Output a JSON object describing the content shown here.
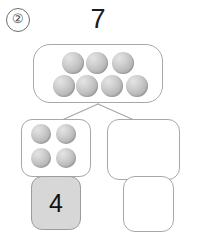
{
  "problem": {
    "number_label": "②"
  },
  "total": {
    "label": "7",
    "counter_count": 7,
    "rows": [
      3,
      4
    ]
  },
  "parts": {
    "left": {
      "counter_count": 4,
      "rows": [
        2,
        2
      ],
      "answer_value": "4",
      "answer_filled": true,
      "answer_fill_color": "#d7d7d7"
    },
    "right": {
      "counter_count": 0,
      "rows": [],
      "answer_value": "",
      "answer_filled": false,
      "answer_fill_color": "#ffffff"
    }
  },
  "style": {
    "box_border_color": "#a8a8a8",
    "counter_color": "#bcbcbc",
    "connector_color": "#a8a8a8",
    "text_color": "#111111",
    "background": "#ffffff"
  },
  "counters": {
    "top_box": [
      {
        "cx": 72,
        "cy": 62,
        "r": 11,
        "name": "counter-1"
      },
      {
        "cx": 96,
        "cy": 62,
        "r": 11,
        "name": "counter-2"
      },
      {
        "cx": 122,
        "cy": 62,
        "r": 11,
        "name": "counter-3"
      },
      {
        "cx": 63,
        "cy": 85,
        "r": 11,
        "name": "counter-4"
      },
      {
        "cx": 86,
        "cy": 85,
        "r": 11,
        "name": "counter-5"
      },
      {
        "cx": 111,
        "cy": 85,
        "r": 11,
        "name": "counter-6"
      },
      {
        "cx": 136,
        "cy": 85,
        "r": 11,
        "name": "counter-7"
      }
    ],
    "left_box": [
      {
        "cx": 40,
        "cy": 133,
        "r": 10,
        "name": "counter-1"
      },
      {
        "cx": 65,
        "cy": 133,
        "r": 10,
        "name": "counter-2"
      },
      {
        "cx": 40,
        "cy": 157,
        "r": 10,
        "name": "counter-3"
      },
      {
        "cx": 65,
        "cy": 157,
        "r": 10,
        "name": "counter-4"
      }
    ],
    "right_box": []
  },
  "connectors": [
    {
      "name": "connector-left",
      "x1": 98,
      "y1": 104,
      "x2": 62,
      "y2": 120
    },
    {
      "name": "connector-right",
      "x1": 98,
      "y1": 104,
      "x2": 134,
      "y2": 120
    }
  ]
}
